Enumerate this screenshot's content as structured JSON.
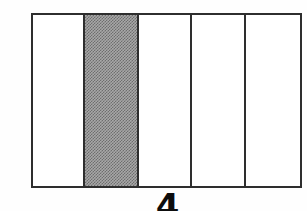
{
  "figure": {
    "type": "schematic-diagram",
    "background_color": "#fefefe",
    "line_color": "#2e2e2e",
    "shade_color": "#a8a8a8",
    "box": {
      "x": 31,
      "y": 13,
      "width": 271,
      "height": 175,
      "border_width": 2
    },
    "columns": [
      {
        "index": 1,
        "name": "column-1",
        "width": 53,
        "shaded": false,
        "label": ""
      },
      {
        "index": 2,
        "name": "column-2",
        "width": 55,
        "shaded": true,
        "label": ""
      },
      {
        "index": 3,
        "name": "column-3",
        "width": 53,
        "shaded": false,
        "label": ""
      },
      {
        "index": 4,
        "name": "column-4",
        "width": 55,
        "shaded": false,
        "label": ""
      },
      {
        "index": 5,
        "name": "column-5",
        "width": 55,
        "shaded": false,
        "label": ""
      }
    ],
    "divider_positions_px": [
      84,
      139,
      192,
      247
    ],
    "caption": {
      "text": "4",
      "clipped": true,
      "color": "#0d0d0d"
    }
  }
}
